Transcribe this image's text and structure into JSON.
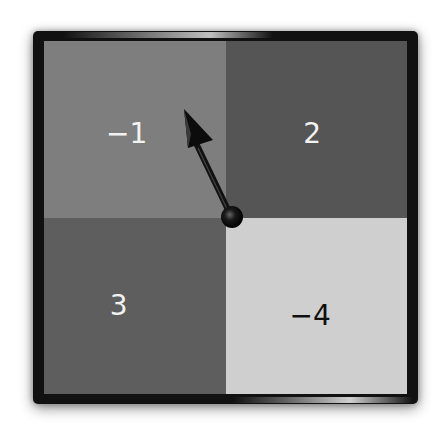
{
  "spinner": {
    "sections": [
      {
        "position": "top-left",
        "label": "−1",
        "value": -1,
        "color": "#7e7e7e"
      },
      {
        "position": "top-right",
        "label": "2",
        "value": 2,
        "color": "#555555"
      },
      {
        "position": "bottom-left",
        "label": "3",
        "value": 3,
        "color": "#5e5e5e"
      },
      {
        "position": "bottom-right",
        "label": "−4",
        "value": -4,
        "color": "#cfcfcf"
      }
    ],
    "pointer_on": "−1"
  }
}
